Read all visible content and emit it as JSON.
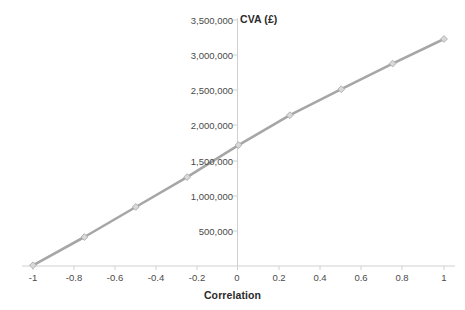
{
  "chart_data": {
    "type": "line",
    "title": "CVA (£)",
    "xlabel": "Correlation",
    "ylabel": "",
    "x": [
      -1,
      -0.75,
      -0.5,
      -0.25,
      0,
      0.25,
      0.5,
      0.75,
      1
    ],
    "values": [
      10000,
      412000,
      840000,
      1265000,
      1720000,
      2145000,
      2515000,
      2880000,
      3230000
    ],
    "series": [
      {
        "name": "CVA",
        "values": [
          10000,
          412000,
          840000,
          1265000,
          1720000,
          2145000,
          2515000,
          2880000,
          3230000
        ]
      }
    ],
    "xlim": [
      -1,
      1
    ],
    "ylim": [
      0,
      3500000
    ],
    "x_ticks": [
      -1,
      -0.8,
      -0.6,
      -0.4,
      -0.2,
      0,
      0.2,
      0.4,
      0.6,
      0.8,
      1
    ],
    "x_tick_labels": [
      "-1",
      "-0.8",
      "-0.6",
      "-0.4",
      "-0.2",
      "0",
      "0.2",
      "0.4",
      "0.6",
      "0.8",
      "1"
    ],
    "y_ticks": [
      500000,
      1000000,
      1500000,
      2000000,
      2500000,
      3000000,
      3500000
    ],
    "y_tick_labels": [
      "500,000",
      "1,000,000",
      "1,500,000",
      "2,000,000",
      "2,500,000",
      "3,000,000",
      "3,500,000"
    ],
    "grid": false,
    "legend": false,
    "legend_position": "none",
    "line_color": "#a6a6a6",
    "marker_color": "#d9d9d9",
    "marker_edge_color": "#b3b3b3",
    "marker_shape": "diamond",
    "axis_color": "#d0d0d0",
    "tick_text_color": "#4a4a4a",
    "title_color": "#2b2b2b",
    "background_color": "#ffffff"
  }
}
